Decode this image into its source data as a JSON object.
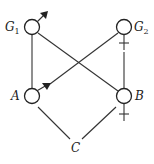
{
  "diagram": {
    "type": "pedigree",
    "nodes": [
      {
        "id": "G1",
        "label": "G",
        "subscript": "1",
        "sex": "male",
        "symbol": "♂"
      },
      {
        "id": "G2",
        "label": "G",
        "subscript": "2",
        "sex": "female",
        "symbol": "♀"
      },
      {
        "id": "A",
        "label": "A",
        "sex": "male",
        "symbol": "♂"
      },
      {
        "id": "B",
        "label": "B",
        "sex": "female",
        "symbol": "♀"
      },
      {
        "id": "C",
        "label": "C"
      }
    ],
    "edges": [
      [
        "G1",
        "A"
      ],
      [
        "G1",
        "B"
      ],
      [
        "G2",
        "A"
      ],
      [
        "G2",
        "B"
      ],
      [
        "A",
        "C"
      ],
      [
        "B",
        "C"
      ]
    ]
  },
  "labels": {
    "g1": "G",
    "g1_sub": "1",
    "g2": "G",
    "g2_sub": "2",
    "a": "A",
    "b": "B",
    "c": "C"
  }
}
